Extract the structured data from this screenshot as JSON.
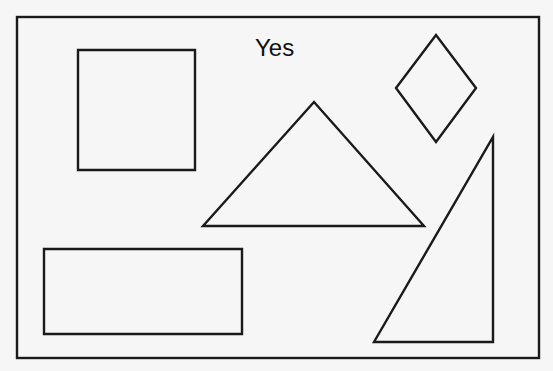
{
  "diagram": {
    "label": "Yes",
    "stroke_color": "#1a1a1a",
    "background": "#f6f6f6",
    "shapes": [
      {
        "name": "square",
        "type": "rect",
        "points": [
          [
            78,
            50
          ],
          [
            195,
            50
          ],
          [
            195,
            170
          ],
          [
            78,
            170
          ]
        ]
      },
      {
        "name": "triangle",
        "type": "polygon",
        "points": [
          [
            314,
            102
          ],
          [
            424,
            226
          ],
          [
            203,
            226
          ]
        ]
      },
      {
        "name": "diamond",
        "type": "polygon",
        "points": [
          [
            436,
            35
          ],
          [
            476,
            88
          ],
          [
            436,
            142
          ],
          [
            396,
            88
          ]
        ]
      },
      {
        "name": "rectangle",
        "type": "rect",
        "points": [
          [
            44,
            249
          ],
          [
            242,
            249
          ],
          [
            242,
            334
          ],
          [
            44,
            334
          ]
        ]
      },
      {
        "name": "right-triangle",
        "type": "polygon",
        "points": [
          [
            493,
            137
          ],
          [
            493,
            342
          ],
          [
            374,
            342
          ]
        ]
      }
    ]
  }
}
